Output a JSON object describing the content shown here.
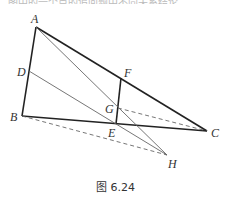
{
  "top_text_cutoff": "图中的一个点的追问题中不同关系结论",
  "caption": "图 6.24",
  "points": {
    "A": {
      "label": "A",
      "x": 36,
      "y": 27
    },
    "B": {
      "label": "B",
      "x": 22,
      "y": 116
    },
    "C": {
      "label": "C",
      "x": 207,
      "y": 131
    },
    "D": {
      "label": "D",
      "x": 29,
      "y": 71
    },
    "E": {
      "label": "E",
      "x": 116,
      "y": 124
    },
    "F": {
      "label": "F",
      "x": 121,
      "y": 78
    },
    "G": {
      "label": "G",
      "x": 118,
      "y": 108
    },
    "H": {
      "label": "H",
      "x": 167,
      "y": 155
    }
  },
  "segments": {
    "solid_thick": [
      "AB",
      "AC",
      "BC",
      "FE"
    ],
    "solid_thin": [
      "AH",
      "DH"
    ],
    "dashed": [
      "BH",
      "GC"
    ]
  }
}
